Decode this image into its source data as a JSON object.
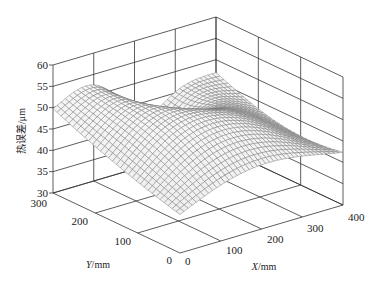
{
  "chart_data": {
    "type": "surface3d",
    "title": "",
    "xlabel": "X/mm",
    "ylabel": "Y/mm",
    "zlabel": "热误差/μm",
    "x_ticks": [
      0,
      100,
      200,
      300,
      400
    ],
    "y_ticks": [
      0,
      100,
      200,
      300
    ],
    "z_ticks": [
      30,
      35,
      40,
      45,
      50,
      55,
      60
    ],
    "xlim": [
      0,
      400
    ],
    "ylim": [
      0,
      300
    ],
    "zlim": [
      30,
      60
    ],
    "grid": true,
    "surface_samples": {
      "x": [
        0,
        100,
        200,
        300,
        400
      ],
      "y": [
        0,
        100,
        200,
        300
      ],
      "z": [
        [
          36,
          40,
          45,
          42,
          38
        ],
        [
          40,
          48,
          56,
          55,
          47
        ],
        [
          45,
          52,
          55,
          57,
          50
        ],
        [
          49,
          54,
          47,
          50,
          46
        ]
      ]
    }
  },
  "labels": {
    "z_axis": "热误差/μm",
    "y_axis": "Y/mm",
    "x_axis": "X/mm",
    "y_axis_prefix": "Y",
    "x_axis_prefix": "X",
    "axis_unit": "/mm"
  },
  "ticks": {
    "z": [
      "30",
      "35",
      "40",
      "45",
      "50",
      "55",
      "60"
    ],
    "y": [
      "0",
      "100",
      "200",
      "300"
    ],
    "x": [
      "0",
      "100",
      "200",
      "300",
      "400"
    ]
  }
}
